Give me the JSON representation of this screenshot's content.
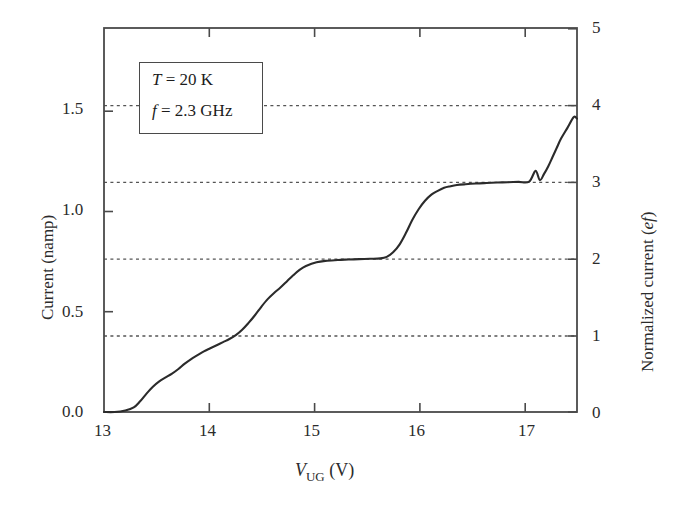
{
  "figure": {
    "background": "#ffffff",
    "line_color": "#2b2b2b",
    "axis_color": "#4a4a4a",
    "grid_color": "#555555"
  },
  "axes": {
    "x": {
      "label_prefix": "V",
      "label_sub": "UG",
      "label_unit": "(V)",
      "ticks": [
        13,
        14,
        15,
        16,
        17
      ],
      "tick_labels": [
        "13",
        "14",
        "15",
        "16",
        "17"
      ],
      "min": 13,
      "max": 17.45
    },
    "y_left": {
      "label": "Current (namp)",
      "ticks": [
        0.0,
        0.5,
        1.0,
        1.5
      ],
      "tick_labels": [
        "0.0",
        "0.5",
        "1.0",
        "1.5"
      ],
      "min": 0,
      "max": 1.842
    },
    "y_right": {
      "label_prefix": "Normalized current (",
      "label_italic": "ef",
      "label_suffix": ")",
      "ticks": [
        0,
        1,
        2,
        3,
        4,
        5
      ],
      "tick_labels": [
        "0",
        "1",
        "2",
        "3",
        "4",
        "5"
      ],
      "min": 0,
      "max": 5
    }
  },
  "legend": {
    "line1_sym": "T",
    "line1_eq": "= 20 K",
    "line2_sym": "f",
    "line2_eq": "= 2.3 GHz"
  },
  "chart_data": {
    "type": "line",
    "title": "",
    "xlabel": "V_UG (V)",
    "ylabel": "Current (namp)",
    "ylabel_secondary": "Normalized current (ef)",
    "xlim": [
      13,
      17.45
    ],
    "ylim": [
      0,
      1.842
    ],
    "ylim_secondary": [
      0,
      5
    ],
    "grid": "horizontal dotted at normalized current = 1, 2, 3, 4",
    "gridlines_normalized": [
      1,
      2,
      3,
      4
    ],
    "legend_position": "upper-left inset box",
    "annotations": [
      "T = 20 K",
      "f = 2.3 GHz"
    ],
    "series": [
      {
        "name": "quantized current staircase",
        "x": [
          13.0,
          13.1,
          13.2,
          13.28,
          13.34,
          13.4,
          13.46,
          13.52,
          13.58,
          13.64,
          13.7,
          13.76,
          13.82,
          13.88,
          13.94,
          14.0,
          14.06,
          14.12,
          14.18,
          14.24,
          14.3,
          14.36,
          14.42,
          14.48,
          14.54,
          14.6,
          14.66,
          14.72,
          14.78,
          14.84,
          14.9,
          15.0,
          15.1,
          15.2,
          15.3,
          15.4,
          15.5,
          15.6,
          15.66,
          15.72,
          15.78,
          15.84,
          15.9,
          15.96,
          16.02,
          16.08,
          16.14,
          16.2,
          16.26,
          16.32,
          16.4,
          16.5,
          16.6,
          16.7,
          16.8,
          16.9,
          17.0,
          17.06,
          17.1,
          17.14,
          17.18,
          17.22,
          17.26,
          17.3,
          17.36,
          17.42,
          17.45
        ],
        "y_normalized": [
          0.0,
          0.0,
          0.02,
          0.06,
          0.14,
          0.24,
          0.33,
          0.4,
          0.45,
          0.5,
          0.56,
          0.63,
          0.69,
          0.74,
          0.79,
          0.83,
          0.87,
          0.91,
          0.95,
          1.0,
          1.07,
          1.16,
          1.26,
          1.37,
          1.47,
          1.55,
          1.62,
          1.7,
          1.78,
          1.85,
          1.9,
          1.95,
          1.97,
          1.98,
          1.985,
          1.99,
          1.995,
          2.0,
          2.02,
          2.08,
          2.18,
          2.33,
          2.5,
          2.64,
          2.75,
          2.83,
          2.88,
          2.92,
          2.94,
          2.955,
          2.965,
          2.975,
          2.982,
          2.988,
          2.992,
          2.996,
          3.0,
          3.14,
          3.02,
          3.1,
          3.2,
          3.32,
          3.44,
          3.56,
          3.7,
          3.84,
          3.82
        ],
        "y_current_namp": [
          0.0,
          0.0,
          0.007,
          0.022,
          0.052,
          0.088,
          0.122,
          0.147,
          0.166,
          0.184,
          0.206,
          0.232,
          0.254,
          0.273,
          0.291,
          0.306,
          0.32,
          0.335,
          0.35,
          0.368,
          0.394,
          0.427,
          0.464,
          0.505,
          0.542,
          0.571,
          0.597,
          0.626,
          0.656,
          0.682,
          0.7,
          0.718,
          0.726,
          0.73,
          0.731,
          0.733,
          0.735,
          0.737,
          0.744,
          0.766,
          0.803,
          0.858,
          0.921,
          0.973,
          1.013,
          1.043,
          1.061,
          1.076,
          1.083,
          1.089,
          1.093,
          1.096,
          1.099,
          1.101,
          1.102,
          1.104,
          1.105,
          1.157,
          1.113,
          1.142,
          1.179,
          1.223,
          1.267,
          1.311,
          1.363,
          1.415,
          1.407
        ]
      }
    ]
  }
}
